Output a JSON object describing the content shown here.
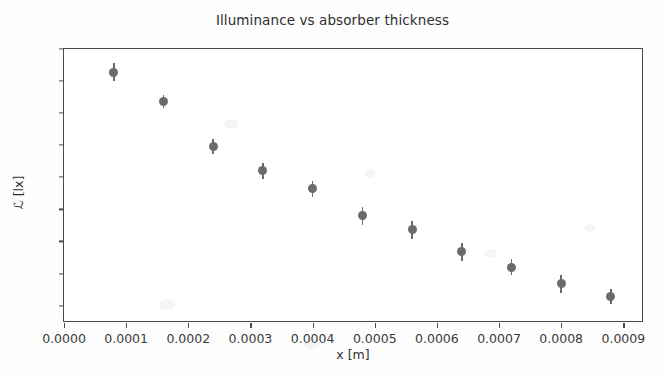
{
  "chart_data": {
    "type": "scatter",
    "title": "Illuminance vs absorber thickness",
    "xlabel": "x [m]",
    "ylabel": "ℒ [lx]",
    "xlim": [
      0.0,
      0.00093
    ],
    "ylim": [
      313,
      525
    ],
    "grid": false,
    "legend": null,
    "marker": {
      "shape": "circle",
      "color": "#6b6b6b",
      "size": 9
    },
    "errorbars": {
      "direction": "vertical",
      "color": "#6b6b6b"
    },
    "xticks": [
      "0.0000",
      "0.0001",
      "0.0002",
      "0.0003",
      "0.0004",
      "0.0005",
      "0.0006",
      "0.0007",
      "0.0008",
      "0.0009"
    ],
    "xtick_values": [
      0.0,
      0.0001,
      0.0002,
      0.0003,
      0.0004,
      0.0005,
      0.0006,
      0.0007,
      0.0008,
      0.0009
    ],
    "yticks": [
      "525",
      "500",
      "475",
      "450",
      "425",
      "400",
      "375",
      "350",
      "325"
    ],
    "ytick_values": [
      525,
      500,
      475,
      450,
      425,
      400,
      375,
      350,
      325
    ],
    "x": [
      8e-05,
      0.00016,
      0.00024,
      0.00032,
      0.0004,
      0.00048,
      0.00056,
      0.00064,
      0.00072,
      0.0008,
      0.00088
    ],
    "y": [
      507,
      484,
      449,
      430,
      416,
      395,
      384,
      367,
      355,
      342,
      332
    ],
    "yerr": [
      7,
      5,
      6,
      6,
      6,
      7,
      7,
      7,
      6,
      7,
      6
    ]
  }
}
